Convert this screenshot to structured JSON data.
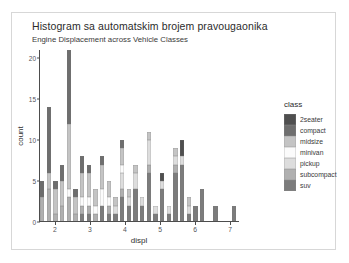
{
  "chart_data": {
    "type": "bar",
    "title": "Histogram sa automatskim brojem pravougaonika",
    "subtitle": "Engine Displacement across Vehicle Classes",
    "xlabel": "displ",
    "ylabel": "count",
    "stacked": true,
    "grid": false,
    "legend_position": "right",
    "legend_title": "class",
    "xlim": [
      1.55,
      7.25
    ],
    "ylim": [
      0,
      21
    ],
    "xticks": [
      "2",
      "3",
      "4",
      "5",
      "6",
      "7"
    ],
    "xtick_values": [
      2,
      3,
      4,
      5,
      6,
      7
    ],
    "yticks": [
      "0",
      "5",
      "10",
      "15",
      "20"
    ],
    "ytick_values": [
      0,
      5,
      10,
      15,
      20
    ],
    "bins": 30,
    "bin_width": 0.19,
    "series": [
      {
        "name": "2seater",
        "color": "#4f4f4f"
      },
      {
        "name": "compact",
        "color": "#6e6e6e"
      },
      {
        "name": "midsize",
        "color": "#c4c4c4"
      },
      {
        "name": "minivan",
        "color": "#fbfbfb"
      },
      {
        "name": "pickup",
        "color": "#dddddd"
      },
      {
        "name": "subcompact",
        "color": "#b0b0b0"
      },
      {
        "name": "suv",
        "color": "#7c7c7c"
      }
    ],
    "bars": [
      {
        "x": 1.64,
        "total": 5,
        "stack": [
          0,
          2,
          0,
          0,
          0,
          3,
          0
        ]
      },
      {
        "x": 1.83,
        "total": 14,
        "stack": [
          0,
          8,
          2,
          0,
          0,
          4,
          0
        ]
      },
      {
        "x": 2.02,
        "total": 5,
        "stack": [
          0,
          1,
          3,
          0,
          0,
          1,
          0
        ]
      },
      {
        "x": 2.21,
        "total": 7,
        "stack": [
          0,
          2,
          3,
          0,
          0,
          2,
          0
        ]
      },
      {
        "x": 2.4,
        "total": 21,
        "stack": [
          0,
          9,
          8,
          1,
          0,
          3,
          0
        ]
      },
      {
        "x": 2.59,
        "total": 4,
        "stack": [
          0,
          1,
          2,
          0,
          0,
          1,
          0
        ]
      },
      {
        "x": 2.78,
        "total": 8,
        "stack": [
          0,
          2,
          3,
          1,
          0,
          1,
          1
        ]
      },
      {
        "x": 2.97,
        "total": 7,
        "stack": [
          0,
          1,
          3,
          1,
          0,
          1,
          1
        ]
      },
      {
        "x": 3.16,
        "total": 4,
        "stack": [
          0,
          0,
          2,
          1,
          0,
          1,
          0
        ]
      },
      {
        "x": 3.35,
        "total": 8,
        "stack": [
          0,
          1,
          3,
          2,
          0,
          0,
          2
        ]
      },
      {
        "x": 3.54,
        "total": 5,
        "stack": [
          0,
          0,
          2,
          1,
          0,
          1,
          1
        ]
      },
      {
        "x": 3.73,
        "total": 3,
        "stack": [
          0,
          0,
          1,
          0,
          1,
          0,
          1
        ]
      },
      {
        "x": 3.92,
        "total": 10,
        "stack": [
          0,
          1,
          2,
          1,
          2,
          1,
          3
        ]
      },
      {
        "x": 4.11,
        "total": 4,
        "stack": [
          0,
          0,
          1,
          0,
          1,
          0,
          2
        ]
      },
      {
        "x": 4.3,
        "total": 7,
        "stack": [
          0,
          0,
          1,
          0,
          2,
          0,
          4
        ]
      },
      {
        "x": 4.49,
        "total": 3,
        "stack": [
          0,
          0,
          0,
          0,
          1,
          0,
          2
        ]
      },
      {
        "x": 4.68,
        "total": 11,
        "stack": [
          0,
          0,
          1,
          0,
          3,
          1,
          6
        ]
      },
      {
        "x": 4.87,
        "total": 2,
        "stack": [
          0,
          0,
          0,
          0,
          1,
          0,
          1
        ]
      },
      {
        "x": 5.06,
        "total": 6,
        "stack": [
          1,
          0,
          0,
          0,
          1,
          0,
          4
        ]
      },
      {
        "x": 5.25,
        "total": 2,
        "stack": [
          0,
          0,
          0,
          0,
          1,
          0,
          1
        ]
      },
      {
        "x": 5.44,
        "total": 9,
        "stack": [
          0,
          0,
          1,
          0,
          1,
          1,
          6
        ]
      },
      {
        "x": 5.63,
        "total": 10,
        "stack": [
          2,
          0,
          0,
          0,
          1,
          0,
          7
        ]
      },
      {
        "x": 5.82,
        "total": 3,
        "stack": [
          0,
          0,
          1,
          0,
          1,
          0,
          1
        ]
      },
      {
        "x": 6.01,
        "total": 2,
        "stack": [
          0,
          0,
          0,
          0,
          0,
          0,
          2
        ]
      },
      {
        "x": 6.2,
        "total": 4,
        "stack": [
          0,
          0,
          0,
          0,
          0,
          0,
          4
        ]
      },
      {
        "x": 6.39,
        "total": 0,
        "stack": [
          0,
          0,
          0,
          0,
          0,
          0,
          0
        ]
      },
      {
        "x": 6.58,
        "total": 2,
        "stack": [
          0,
          0,
          0,
          0,
          0,
          0,
          2
        ]
      },
      {
        "x": 6.77,
        "total": 0,
        "stack": [
          0,
          0,
          0,
          0,
          0,
          0,
          0
        ]
      },
      {
        "x": 6.96,
        "total": 0,
        "stack": [
          0,
          0,
          0,
          0,
          0,
          0,
          0
        ]
      },
      {
        "x": 7.1,
        "total": 2,
        "stack": [
          0,
          0,
          0,
          0,
          0,
          0,
          2
        ]
      }
    ]
  },
  "legend": {
    "title": "class",
    "items": [
      {
        "label": "2seater",
        "color": "#4f4f4f"
      },
      {
        "label": "compact",
        "color": "#6e6e6e"
      },
      {
        "label": "midsize",
        "color": "#c4c4c4"
      },
      {
        "label": "minivan",
        "color": "#fbfbfb"
      },
      {
        "label": "pickup",
        "color": "#dddddd"
      },
      {
        "label": "subcompact",
        "color": "#b0b0b0"
      },
      {
        "label": "suv",
        "color": "#7c7c7c"
      }
    ]
  }
}
